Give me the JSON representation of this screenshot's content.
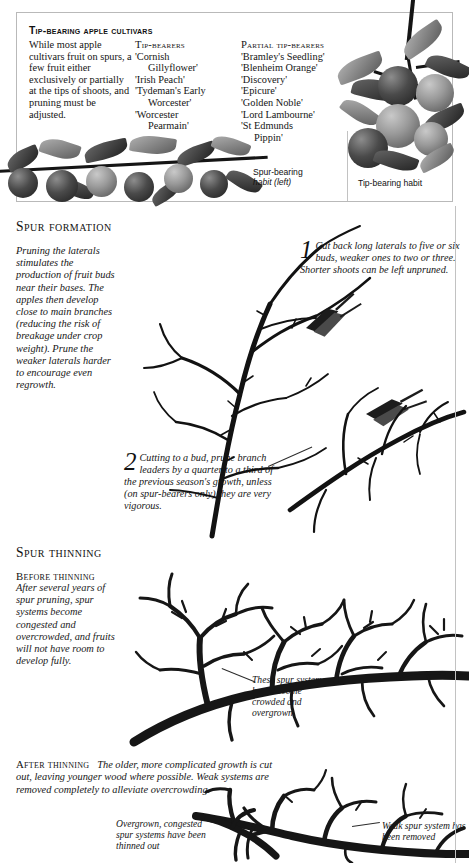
{
  "page": {
    "background": "#ffffff",
    "ink": "#1a1a1a"
  },
  "tip_panel": {
    "title": "Tip-bearing apple cultivars",
    "intro": "While most apple cultivars fruit on spurs, a few fruit either exclusively or partially at the tips of shoots, and pruning must be adjusted.",
    "tip_bearers": {
      "heading": "Tip-bearers",
      "items": [
        "'Cornish",
        "Gillyflower'",
        "'Irish Peach'",
        "'Tydeman's Early",
        "Worcester'",
        "'Worcester",
        "Pearmain'"
      ]
    },
    "partial_tip_bearers": {
      "heading": "Partial tip-bearers",
      "items": [
        "'Bramley's Seedling'",
        "'Blenheim Orange'",
        "'Discovery'",
        "'Epicure'",
        "'Golden Noble'",
        "'Lord Lambourne'",
        "'St Edmunds",
        "Pippin'"
      ]
    },
    "captions": {
      "spur_habit": "Spur-bearing habit (left)",
      "spur_habit_main": "Spur-bearing",
      "spur_habit_sub": "habit (left)",
      "tip_habit": "Tip-bearing habit"
    }
  },
  "spur_formation": {
    "heading": "Spur formation",
    "intro": "Pruning the laterals stimulates the production of fruit buds near their bases. The apples then develop close to main branches (reducing the risk of breakage under crop weight). Prune the weaker laterals harder to encourage even regrowth.",
    "steps": [
      {
        "number": "1",
        "text": "Cut back long laterals to five or six buds, weaker ones to two or three. Shorter shoots can be left unpruned."
      },
      {
        "number": "2",
        "text": "Cutting to a bud, prune branch leaders by a quarter to a third of the previous season's growth, unless (on spur-bearers only) they are very vigorous."
      }
    ]
  },
  "spur_thinning": {
    "heading": "Spur thinning",
    "before": {
      "heading": "Before thinning",
      "text": "After several years of spur pruning, spur systems become congested and overcrowded, and fruits will not have room to develop fully."
    },
    "after": {
      "heading": "After thinning",
      "text": "The older, more complicated growth is cut out, leaving younger wood where possible. Weak systems are removed completely to alleviate overcrowding."
    },
    "annotations": {
      "crowded": "These spur systems have become crowded and overgrown",
      "overgrown": "Overgrown, congested spur systems have been thinned out",
      "weak_removed": "Weak spur system has been removed"
    }
  }
}
